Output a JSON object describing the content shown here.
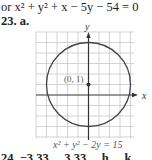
{
  "equation_line": {
    "prefix": "or ",
    "text": "x² + y² + x − 5y − 54 = 0"
  },
  "problem": {
    "number": "23.",
    "part": "a."
  },
  "graph": {
    "x_axis_label": "x",
    "y_axis_label": "y",
    "center_label": "(0, 1)",
    "center": [
      0,
      1
    ],
    "radius": 4,
    "caption": "x² + y² − 2y = 15"
  },
  "next_line": {
    "text": "24.   −3.33 ... 3.33 ... h ... k ..."
  }
}
